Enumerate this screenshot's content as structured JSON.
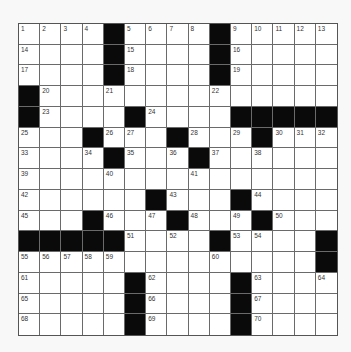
{
  "puzzle": {
    "rows": 15,
    "cols": 15,
    "colors": {
      "block": "#0a0a0a",
      "cell": "#ffffff",
      "gridline": "#6a6a6a",
      "background": "#f8f8f8"
    },
    "grid": [
      [
        "1",
        "2",
        "3",
        "4",
        "#",
        "5",
        "6",
        "7",
        "8",
        "#",
        "9",
        "10",
        "11",
        "12",
        "13"
      ],
      [
        "14",
        "",
        "",
        "",
        "#",
        "15",
        "",
        "",
        "",
        "#",
        "16",
        "",
        "",
        "",
        ""
      ],
      [
        "17",
        "",
        "",
        "",
        "#",
        "18",
        "",
        "",
        "",
        "#",
        "19",
        "",
        "",
        "",
        ""
      ],
      [
        "#",
        "20",
        "",
        "",
        "21",
        "",
        "",
        "",
        "",
        "22",
        "",
        "",
        "",
        "",
        ""
      ],
      [
        "#",
        "23",
        "",
        "",
        "",
        "#",
        "24",
        "",
        "",
        "",
        "#",
        "#",
        "#",
        "#",
        "#"
      ],
      [
        "25",
        "",
        "",
        "#",
        "26",
        "27",
        "",
        "#",
        "28",
        "",
        "29",
        "#",
        "30",
        "31",
        "32"
      ],
      [
        "33",
        "",
        "",
        "34",
        "#",
        "35",
        "",
        "36",
        "#",
        "37",
        "",
        "38",
        "",
        "",
        ""
      ],
      [
        "39",
        "",
        "",
        "",
        "40",
        "",
        "",
        "",
        "41",
        "",
        "",
        "",
        "",
        "",
        ""
      ],
      [
        "42",
        "",
        "",
        "",
        "",
        "",
        "#",
        "43",
        "",
        "",
        "#",
        "44",
        "",
        "",
        ""
      ],
      [
        "45",
        "",
        "",
        "#",
        "46",
        "",
        "47",
        "#",
        "48",
        "",
        "49",
        "#",
        "50",
        "",
        ""
      ],
      [
        "#",
        "#",
        "#",
        "#",
        "#",
        "51",
        "",
        "52",
        "",
        "#",
        "53",
        "54",
        "",
        "",
        "#"
      ],
      [
        "55",
        "56",
        "57",
        "58",
        "59",
        "",
        "",
        "",
        "",
        "60",
        "",
        "",
        "",
        "",
        "#"
      ],
      [
        "61",
        "",
        "",
        "",
        "",
        "#",
        "62",
        "",
        "",
        "",
        "#",
        "63",
        "",
        "",
        "64"
      ],
      [
        "65",
        "",
        "",
        "",
        "",
        "#",
        "66",
        "",
        "",
        "",
        "#",
        "67",
        "",
        "",
        ""
      ],
      [
        "68",
        "",
        "",
        "",
        "",
        "#",
        "69",
        "",
        "",
        "",
        "#",
        "70",
        "",
        "",
        ""
      ]
    ]
  }
}
